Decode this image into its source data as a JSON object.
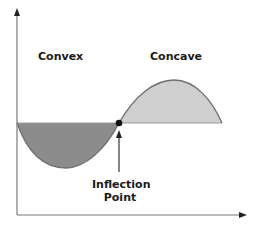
{
  "diagram": {
    "labels": {
      "convex": "Convex",
      "concave": "Concave",
      "inflection_line1": "Inflection",
      "inflection_line2": "Point"
    },
    "colors": {
      "convex_fill": "#8c8c8c",
      "concave_fill": "#cfcfcf",
      "curve_stroke": "#6e6e6e",
      "axis": "#7a7a7a",
      "point": "#111111",
      "text": "#1a1a1a"
    },
    "geometry": {
      "origin": [
        17,
        215
      ],
      "y_axis_top": 10,
      "x_axis_right": 246,
      "baseline_y": 123,
      "inflection_point": [
        119,
        123
      ],
      "convex_min": [
        66,
        167
      ],
      "concave_max": [
        174,
        80
      ],
      "curve_start_x": 17,
      "curve_end_x": 222
    }
  }
}
